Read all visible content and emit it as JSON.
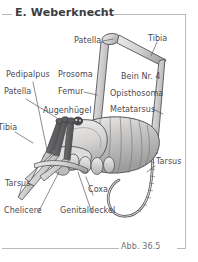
{
  "page": {
    "title": "E. Weberknecht",
    "figure_caption": "Abb. 36.5",
    "language": "de"
  },
  "colors": {
    "text": "#4a4a52",
    "title_text": "#3b3b42",
    "rule": "#b9b9bd",
    "leader_line": "#5a5a62",
    "body_fill_light": "#e2e1e0",
    "body_fill_mid": "#c9c8c7",
    "body_fill_dark": "#a9a8a8",
    "leg_dark": "#6d6c6e",
    "leg_light": "#d8d7d6",
    "outline": "#55555c",
    "background": "#ffffff"
  },
  "labels": [
    {
      "id": "patella-top",
      "text": "Patella",
      "x": 74,
      "y": 37,
      "align": "left"
    },
    {
      "id": "tibia-top",
      "text": "Tibia",
      "x": 148,
      "y": 35,
      "align": "left"
    },
    {
      "id": "pedipalpus",
      "text": "Pedipalpus",
      "x": 6,
      "y": 71,
      "align": "left"
    },
    {
      "id": "prosoma",
      "text": "Prosoma",
      "x": 58,
      "y": 71,
      "align": "left"
    },
    {
      "id": "bein-nr-4",
      "text": "Bein Nr. 4",
      "x": 121,
      "y": 73,
      "align": "left"
    },
    {
      "id": "patella-left",
      "text": "Patella",
      "x": 4,
      "y": 88,
      "align": "left"
    },
    {
      "id": "femur",
      "text": "Femur",
      "x": 58,
      "y": 88,
      "align": "left"
    },
    {
      "id": "opisthosoma",
      "text": "Opisthosoma",
      "x": 110,
      "y": 90,
      "align": "left"
    },
    {
      "id": "augenhuegel",
      "text": "Augenhügel",
      "x": 43,
      "y": 107,
      "align": "left"
    },
    {
      "id": "metatarsus",
      "text": "Metatarsus",
      "x": 110,
      "y": 106,
      "align": "left"
    },
    {
      "id": "tibia-left",
      "text": "Tibia",
      "x": -2,
      "y": 124,
      "align": "left"
    },
    {
      "id": "tarsus-right",
      "text": "Tarsus",
      "x": 156,
      "y": 158,
      "align": "left"
    },
    {
      "id": "tarsus-left",
      "text": "Tarsus",
      "x": 5,
      "y": 180,
      "align": "left"
    },
    {
      "id": "coxa",
      "text": "Coxa",
      "x": 88,
      "y": 186,
      "align": "left"
    },
    {
      "id": "chelicere",
      "text": "Chelicere",
      "x": 4,
      "y": 207,
      "align": "left"
    },
    {
      "id": "genitaldeckel",
      "text": "Genitaldeckel",
      "x": 60,
      "y": 207,
      "align": "left"
    }
  ],
  "anatomy_parts": [
    "Patella",
    "Tibia",
    "Pedipalpus",
    "Prosoma",
    "Bein Nr. 4",
    "Femur",
    "Opisthosoma",
    "Augenhügel",
    "Metatarsus",
    "Tarsus",
    "Coxa",
    "Chelicere",
    "Genitaldeckel"
  ]
}
